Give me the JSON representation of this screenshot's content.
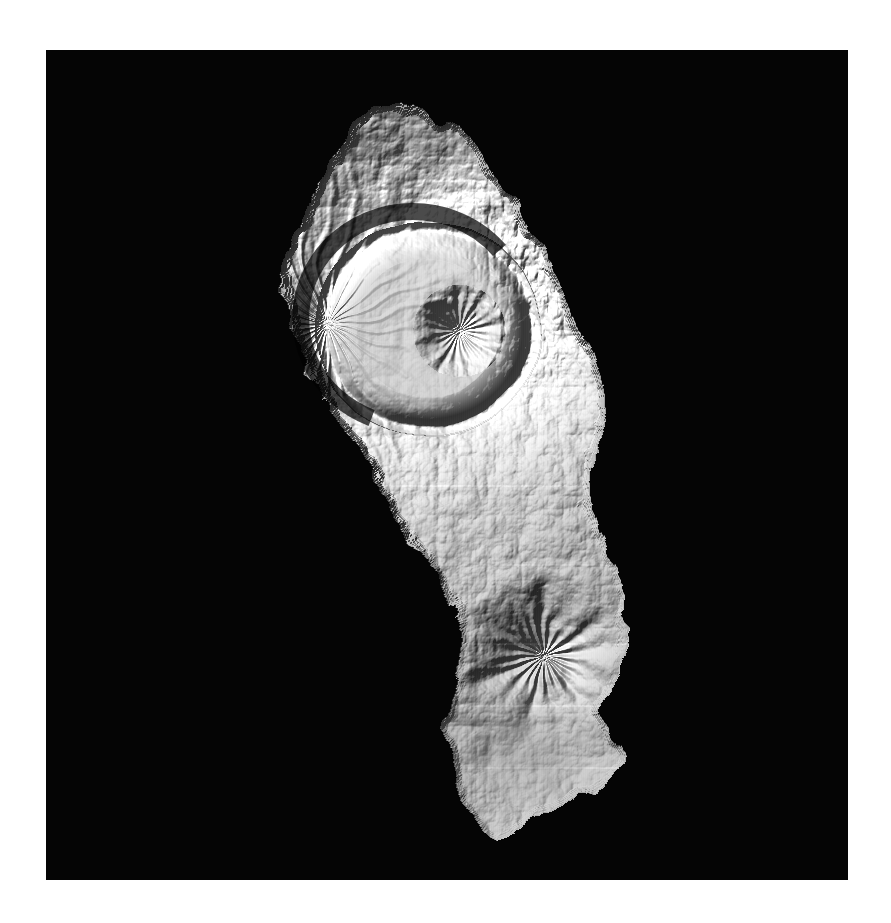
{
  "page": {
    "background_color": "#ffffff",
    "width": 891,
    "height": 923
  },
  "map_panel": {
    "name": "hillshade-relief-map",
    "background_color": "#050505",
    "x": 46,
    "y": 50,
    "width": 802,
    "height": 830,
    "render_style": "grayscale-hillshade",
    "illumination": {
      "azimuth_deg": 315,
      "altitude_deg": 45,
      "light_from": "northwest"
    },
    "palette": {
      "sea": "#050505",
      "terrain_low": "#6e6e6e",
      "terrain_mid": "#a8a8a8",
      "terrain_high": "#e8e8e8",
      "terrain_peak": "#fdfdfd",
      "shadow": "#1a1a1a",
      "deep_shadow": "#0d0d0d"
    },
    "artifacts": {
      "tile_seams": "faint horizontal lines across the DEM mosaic",
      "seam_rows_pct": [
        52.5,
        62.0,
        71.5,
        79.0,
        86.5
      ]
    }
  },
  "island": {
    "name": "volcanic-island",
    "shape_description": "elongated north-south island, broad rounded northern lobe tapering through a narrow curved waist to a rounded southern lobe with a small southern tail",
    "outline_pct": [
      [
        40.5,
        7.5
      ],
      [
        43.5,
        6.2
      ],
      [
        46.5,
        7.0
      ],
      [
        48.5,
        9.0
      ],
      [
        50.5,
        8.2
      ],
      [
        52.0,
        10.5
      ],
      [
        54.5,
        12.5
      ],
      [
        56.0,
        15.5
      ],
      [
        58.5,
        18.0
      ],
      [
        60.0,
        21.5
      ],
      [
        62.5,
        24.0
      ],
      [
        63.5,
        27.5
      ],
      [
        65.5,
        30.0
      ],
      [
        66.5,
        33.5
      ],
      [
        68.0,
        36.0
      ],
      [
        69.5,
        39.5
      ],
      [
        70.0,
        43.0
      ],
      [
        69.0,
        46.5
      ],
      [
        68.0,
        49.5
      ],
      [
        67.5,
        53.0
      ],
      [
        68.5,
        56.5
      ],
      [
        70.0,
        60.0
      ],
      [
        71.0,
        63.5
      ],
      [
        72.0,
        67.0
      ],
      [
        72.5,
        70.5
      ],
      [
        71.5,
        74.0
      ],
      [
        70.0,
        77.0
      ],
      [
        69.0,
        80.0
      ],
      [
        70.5,
        83.0
      ],
      [
        72.0,
        85.5
      ],
      [
        70.0,
        88.0
      ],
      [
        66.5,
        90.0
      ],
      [
        63.0,
        91.5
      ],
      [
        59.5,
        93.5
      ],
      [
        56.5,
        95.0
      ],
      [
        54.0,
        93.0
      ],
      [
        52.0,
        90.5
      ],
      [
        51.0,
        87.5
      ],
      [
        50.0,
        84.5
      ],
      [
        49.5,
        81.0
      ],
      [
        50.5,
        77.5
      ],
      [
        51.5,
        74.0
      ],
      [
        52.0,
        70.5
      ],
      [
        51.0,
        67.0
      ],
      [
        49.5,
        64.0
      ],
      [
        47.5,
        61.5
      ],
      [
        45.5,
        59.0
      ],
      [
        43.5,
        56.0
      ],
      [
        41.5,
        52.5
      ],
      [
        39.5,
        49.0
      ],
      [
        37.0,
        45.5
      ],
      [
        34.5,
        42.0
      ],
      [
        32.5,
        38.5
      ],
      [
        31.0,
        35.0
      ],
      [
        30.0,
        31.5
      ],
      [
        29.5,
        28.0
      ],
      [
        30.0,
        24.5
      ],
      [
        31.5,
        21.0
      ],
      [
        33.0,
        17.5
      ],
      [
        35.0,
        14.5
      ],
      [
        37.0,
        11.5
      ],
      [
        38.5,
        9.0
      ]
    ]
  },
  "features": [
    {
      "name": "northern-caldera",
      "type": "caldera",
      "center_pct": [
        47.5,
        33.5
      ],
      "radius_x_pct": 12.5,
      "radius_y_pct": 11.5,
      "floor_tone": "#d2d2d2",
      "rim_shadow_arc": "northwest rim carries the darkest shadow band"
    },
    {
      "name": "central-cone",
      "type": "stratocone",
      "center_pct": [
        51.5,
        33.8
      ],
      "radius_pct": 5.0,
      "summit_tone": "#fefefe",
      "description": "bright symmetric cone with radial gullies sitting inside the caldera"
    },
    {
      "name": "northern-highlands",
      "type": "ridged-highland",
      "center_pct": [
        46.0,
        17.0
      ],
      "description": "dissected ridges and steep northeast-facing scarps at the island's north tip"
    },
    {
      "name": "northeast-ridge-flank",
      "type": "ridge-system",
      "center_pct": [
        61.0,
        27.0
      ],
      "description": "parallel knife-edge ridges descending to the east coast"
    },
    {
      "name": "western-radial-drainage",
      "type": "drainage",
      "center_pct": [
        35.0,
        33.0
      ],
      "description": "fine radial gullies fanning down the western outer flank"
    },
    {
      "name": "central-waist",
      "type": "eroded-saddle",
      "center_pct": [
        55.0,
        52.0
      ],
      "description": "narrow rugged isthmus of strongly incised valleys joining the two lobes"
    },
    {
      "name": "western-collapse-scarp",
      "type": "scarp",
      "center_pct": [
        49.0,
        58.0
      ],
      "description": "sharp concave arc cut into the west coast at the waist"
    },
    {
      "name": "southern-volcano",
      "type": "stratocone",
      "center_pct": [
        62.0,
        73.0
      ],
      "radius_pct": 7.5,
      "summit_tone": "#f4f4f4",
      "description": "rounded southern cone with a dark shadowed south-facing summit hollow"
    },
    {
      "name": "southern-lowland-plain",
      "type": "plain",
      "center_pct": [
        60.0,
        85.0
      ],
      "tone": "#a0a0a0",
      "description": "smooth low-relief plain forming the southern tail"
    },
    {
      "name": "southern-tail",
      "type": "peninsula",
      "center_pct": [
        62.0,
        92.0
      ],
      "description": "small ragged spit at the extreme south"
    }
  ]
}
